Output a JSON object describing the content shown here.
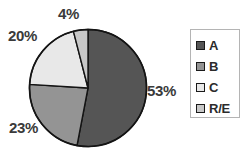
{
  "chart_data": {
    "type": "pie",
    "title": "",
    "subtitle": "",
    "xlabel": "",
    "ylabel": "",
    "grid": false,
    "legend_position": "right",
    "categories": [
      "A",
      "B",
      "C",
      "R/E"
    ],
    "values": [
      53,
      23,
      20,
      4
    ],
    "value_unit": "%",
    "data_labels": [
      "53%",
      "23%",
      "20%",
      "4%"
    ],
    "slice_colors": [
      "#555555",
      "#949494",
      "#e8e8e8",
      "#c8c8c8"
    ],
    "slice_outline_color": "#141414",
    "start_angle_deg": 0,
    "direction": "clockwise",
    "slices": [
      {
        "name": "A",
        "value": 53,
        "label": "53%",
        "color": "#555555"
      },
      {
        "name": "B",
        "value": 23,
        "label": "23%",
        "color": "#949494"
      },
      {
        "name": "C",
        "value": 20,
        "label": "20%",
        "color": "#e8e8e8"
      },
      {
        "name": "R/E",
        "value": 4,
        "label": "4%",
        "color": "#c8c8c8"
      }
    ]
  },
  "labels": {
    "a": "53%",
    "b": "23%",
    "c": "20%",
    "re": "4%"
  },
  "legend": {
    "items": [
      {
        "label": "A",
        "color": "#555555"
      },
      {
        "label": "B",
        "color": "#949494"
      },
      {
        "label": "C",
        "color": "#e8e8e8"
      },
      {
        "label": "R/E",
        "color": "#c8c8c8"
      }
    ]
  }
}
